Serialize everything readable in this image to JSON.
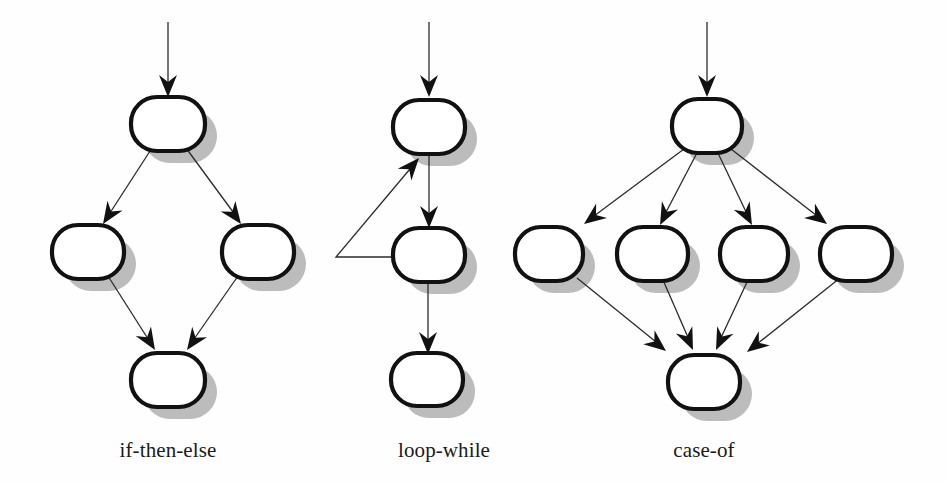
{
  "figure": {
    "background_color": "#fefefe",
    "node_fill": "#ffffff",
    "node_stroke": "#111111",
    "node_shadow_color": "#bcbcbc",
    "edge_color": "#2b2b2b",
    "arrow_color": "#111111",
    "caption_color": "#1a1a1a"
  },
  "diagrams": [
    {
      "id": "if-then-else",
      "caption": "if-then-else",
      "caption_x": 168,
      "caption_y": 457,
      "node_count": 4,
      "nodes": [
        {
          "name": "condition",
          "cx": 168,
          "cy": 124,
          "rx": 37,
          "ry": 27
        },
        {
          "name": "then-branch",
          "cx": 88,
          "cy": 252,
          "rx": 36,
          "ry": 27
        },
        {
          "name": "else-branch",
          "cx": 258,
          "cy": 252,
          "rx": 36,
          "ry": 27
        },
        {
          "name": "join",
          "cx": 168,
          "cy": 380,
          "rx": 37,
          "ry": 27
        }
      ],
      "edges": [
        {
          "from": "entry",
          "to": "condition",
          "type": "entry"
        },
        {
          "from": "condition",
          "to": "then-branch",
          "type": "branch"
        },
        {
          "from": "condition",
          "to": "else-branch",
          "type": "branch"
        },
        {
          "from": "then-branch",
          "to": "join",
          "type": "merge"
        },
        {
          "from": "else-branch",
          "to": "join",
          "type": "merge"
        }
      ]
    },
    {
      "id": "loop-while",
      "caption": "loop-while",
      "caption_x": 444,
      "caption_y": 457,
      "node_count": 3,
      "nodes": [
        {
          "name": "loop-header",
          "cx": 429,
          "cy": 126,
          "rx": 36,
          "ry": 27
        },
        {
          "name": "loop-body",
          "cx": 429,
          "cy": 254,
          "rx": 36,
          "ry": 27
        },
        {
          "name": "loop-exit",
          "cx": 427,
          "cy": 379,
          "rx": 36,
          "ry": 26
        }
      ],
      "edges": [
        {
          "from": "entry",
          "to": "loop-header",
          "type": "entry"
        },
        {
          "from": "loop-header",
          "to": "loop-body",
          "type": "forward"
        },
        {
          "from": "loop-body",
          "to": "loop-header",
          "type": "back-edge"
        },
        {
          "from": "loop-body",
          "to": "loop-exit",
          "type": "forward"
        }
      ]
    },
    {
      "id": "case-of",
      "caption": "case-of",
      "caption_x": 704,
      "caption_y": 457,
      "node_count": 6,
      "nodes": [
        {
          "name": "selector",
          "cx": 707,
          "cy": 125,
          "rx": 35,
          "ry": 27
        },
        {
          "name": "case-1",
          "cx": 549,
          "cy": 253,
          "rx": 34,
          "ry": 27
        },
        {
          "name": "case-2",
          "cx": 652,
          "cy": 253,
          "rx": 35,
          "ry": 27
        },
        {
          "name": "case-3",
          "cx": 754,
          "cy": 253,
          "rx": 34,
          "ry": 27
        },
        {
          "name": "case-4",
          "cx": 856,
          "cy": 253,
          "rx": 36,
          "ry": 27
        },
        {
          "name": "join",
          "cx": 704,
          "cy": 381,
          "rx": 36,
          "ry": 27
        }
      ],
      "edges": [
        {
          "from": "entry",
          "to": "selector",
          "type": "entry"
        },
        {
          "from": "selector",
          "to": "case-1",
          "type": "branch"
        },
        {
          "from": "selector",
          "to": "case-2",
          "type": "branch"
        },
        {
          "from": "selector",
          "to": "case-3",
          "type": "branch"
        },
        {
          "from": "selector",
          "to": "case-4",
          "type": "branch"
        },
        {
          "from": "case-1",
          "to": "join",
          "type": "merge"
        },
        {
          "from": "case-2",
          "to": "join",
          "type": "merge"
        },
        {
          "from": "case-3",
          "to": "join",
          "type": "merge"
        },
        {
          "from": "case-4",
          "to": "join",
          "type": "merge"
        }
      ]
    }
  ]
}
